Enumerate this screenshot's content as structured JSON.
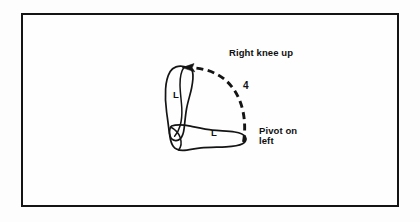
{
  "figure": {
    "type": "dance-step-footwork-diagram",
    "background_color": "#fdfdfd",
    "ink_color": "#141414",
    "border": {
      "name": "figure-frame",
      "color": "#141414",
      "width_px": 2
    }
  },
  "annotations": {
    "right_knee_up": "Right knee up",
    "pivot_on_left": "Pivot on\nleft",
    "step_number": "4"
  },
  "footprints": [
    {
      "id": "foot-vertical",
      "label": "L",
      "foot": "left",
      "orientation": "toes-up",
      "description": "Upright left footprint, toes pointing up"
    },
    {
      "id": "foot-horizontal",
      "label": "L",
      "foot": "left",
      "orientation": "toes-right",
      "description": "Left footprint rotated, toes pointing right"
    }
  ],
  "motion_arc": {
    "id": "pivot-arc",
    "style": "dashed",
    "arrowhead": "left-pointing",
    "label": "4",
    "description": "Dashed arc showing pivot rotation from toes-right to toes-up"
  }
}
